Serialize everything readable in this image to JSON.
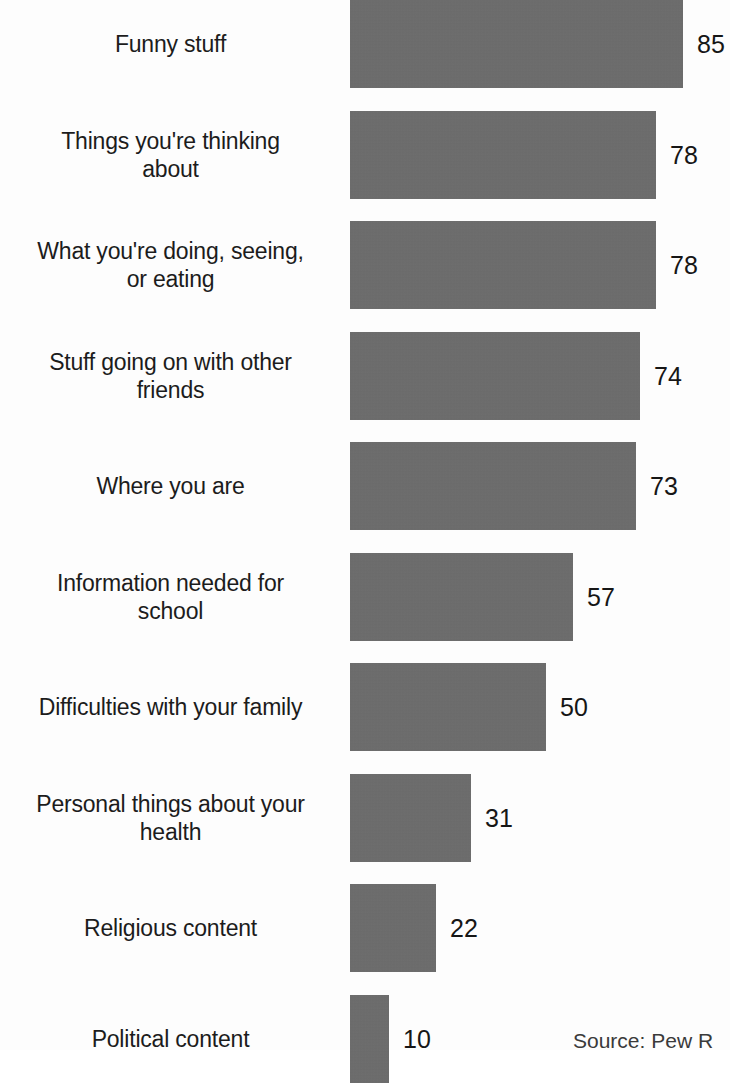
{
  "chart_data": {
    "type": "bar",
    "orientation": "horizontal",
    "title": "",
    "subtitle": "",
    "xlabel": "",
    "ylabel": "",
    "xlim": [
      0,
      85
    ],
    "grid": false,
    "legend": null,
    "bar_color": "#6b6b6b",
    "background_color": "#fdfdfd",
    "value_suffix": "",
    "categories": [
      "Funny stuff",
      "Things you're thinking about",
      "What you're doing, seeing, or eating",
      "Stuff going on with other friends",
      "Where you are",
      "Information needed for school",
      "Difficulties with your family",
      "Personal things about your health",
      "Religious content",
      "Political content"
    ],
    "values": [
      85,
      78,
      78,
      74,
      73,
      57,
      50,
      31,
      22,
      10
    ]
  },
  "bars": [
    {
      "label": "Funny stuff",
      "label_lines": "Funny stuff",
      "value": 85,
      "value_text": "85"
    },
    {
      "label": "Things you're thinking about",
      "label_lines": "Things you're thinking\nabout",
      "value": 78,
      "value_text": "78"
    },
    {
      "label": "What you're doing, seeing, or eating",
      "label_lines": "What you're doing, seeing,\nor eating",
      "value": 78,
      "value_text": "78"
    },
    {
      "label": "Stuff going on with other friends",
      "label_lines": "Stuff going on with other\nfriends",
      "value": 74,
      "value_text": "74"
    },
    {
      "label": "Where you are",
      "label_lines": "Where you are",
      "value": 73,
      "value_text": "73"
    },
    {
      "label": "Information needed for school",
      "label_lines": "Information needed for\nschool",
      "value": 57,
      "value_text": "57"
    },
    {
      "label": "Difficulties with your family",
      "label_lines": "Difficulties with your family",
      "value": 50,
      "value_text": "50"
    },
    {
      "label": "Personal things about your health",
      "label_lines": "Personal things about your\nhealth",
      "value": 31,
      "value_text": "31"
    },
    {
      "label": "Religious content",
      "label_lines": "Religious content",
      "value": 22,
      "value_text": "22"
    },
    {
      "label": "Political content",
      "label_lines": "Political content",
      "value": 10,
      "value_text": "10"
    }
  ],
  "footer": {
    "source_text": "Source: Pew R"
  }
}
